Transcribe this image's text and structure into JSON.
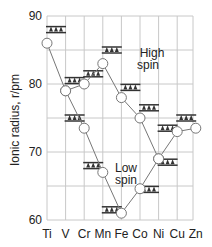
{
  "chart_data": {
    "type": "line",
    "title": "",
    "xlabel": "",
    "ylabel": "Ionic radius, r/pm",
    "ylim": [
      60,
      90
    ],
    "yticks": [
      60,
      70,
      80,
      90
    ],
    "grid": true,
    "categories": [
      "Ti",
      "V",
      "Cr",
      "Mn",
      "Fe",
      "Co",
      "Ni",
      "Cu",
      "Zn"
    ],
    "series": [
      {
        "name": "High spin",
        "values": [
          86,
          79,
          80,
          83,
          78,
          75,
          69,
          73,
          73.5
        ]
      },
      {
        "name": "Low spin",
        "values": [
          null,
          79,
          73.5,
          67,
          61,
          64.6,
          69,
          null,
          null
        ]
      }
    ],
    "annotations": [
      {
        "text": "High",
        "line2": "spin"
      },
      {
        "text": "Low",
        "line2": "spin"
      }
    ],
    "orbital_diagrams": [
      {
        "element": "Ti",
        "config": "high",
        "y": 88
      },
      {
        "element": "V",
        "config": "high",
        "y": 80.5
      },
      {
        "element": "V",
        "config": "low",
        "y": 75
      },
      {
        "element": "Cr",
        "config": "high",
        "y": 81.5
      },
      {
        "element": "Cr",
        "config": "low",
        "y": 68
      },
      {
        "element": "Mn",
        "config": "high",
        "y": 85
      },
      {
        "element": "Mn",
        "config": "low",
        "y": 61.5
      },
      {
        "element": "Fe",
        "config": "high",
        "y": 79.5
      },
      {
        "element": "Co",
        "config": "high",
        "y": 76.5
      },
      {
        "element": "Co",
        "config": "low",
        "y": 64.5
      },
      {
        "element": "Ni",
        "config": "high",
        "y": 73.5
      },
      {
        "element": "Ni",
        "config": "low",
        "y": 68.5
      },
      {
        "element": "Cu",
        "config": "high",
        "y": 75
      }
    ]
  },
  "labels": {
    "ylabel": "Ionic radius, r/pm",
    "high1": "High",
    "high2": "spin",
    "low1": "Low",
    "low2": "spin"
  },
  "colors": {
    "grid": "#c8c8c8",
    "line": "#777777",
    "marker_fill": "#ffffff",
    "marker_stroke": "#777777",
    "orbital": "#333333"
  }
}
